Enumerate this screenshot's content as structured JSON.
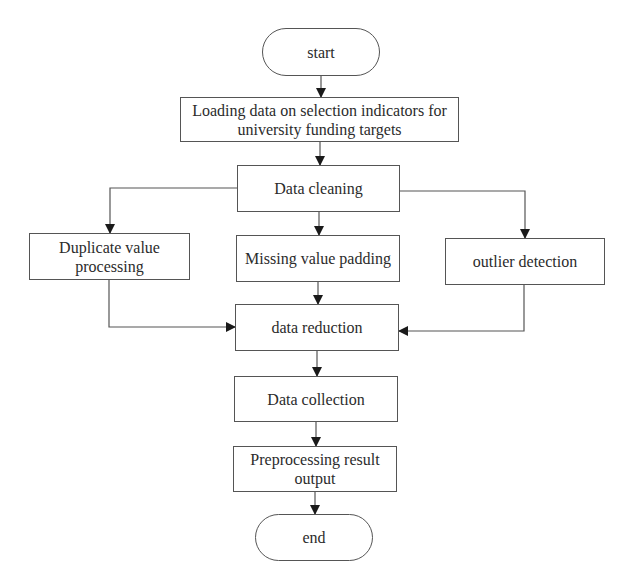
{
  "diagram": {
    "type": "flowchart",
    "nodes": {
      "start": "start",
      "loading": "Loading data on selection indicators for university funding targets",
      "cleaning": "Data cleaning",
      "duplicate": "Duplicate value processing",
      "missing": "Missing value padding",
      "outlier": "outlier detection",
      "reduction": "data reduction",
      "collection": "Data collection",
      "preprocessing": "Preprocessing result output",
      "end": "end"
    },
    "edges": [
      [
        "start",
        "loading"
      ],
      [
        "loading",
        "cleaning"
      ],
      [
        "cleaning",
        "duplicate"
      ],
      [
        "cleaning",
        "missing"
      ],
      [
        "cleaning",
        "outlier"
      ],
      [
        "duplicate",
        "reduction"
      ],
      [
        "missing",
        "reduction"
      ],
      [
        "outlier",
        "reduction"
      ],
      [
        "reduction",
        "collection"
      ],
      [
        "collection",
        "preprocessing"
      ],
      [
        "preprocessing",
        "end"
      ]
    ],
    "colors": {
      "line": "#555555",
      "arrow": "#1a1a1a",
      "text": "#2b2b2b",
      "background": "#ffffff"
    }
  }
}
